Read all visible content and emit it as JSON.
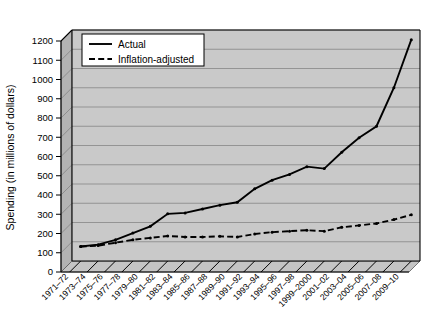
{
  "chart_data": {
    "type": "line",
    "title": "",
    "xlabel": "",
    "ylabel": "Spending (in millions of dollars)",
    "ylim": [
      0,
      1200
    ],
    "ytick_step": 100,
    "grid": true,
    "legend_position": "top-left",
    "categories": [
      "1971–72",
      "1973–74",
      "1975–76",
      "1977–78",
      "1979–80",
      "1981–82",
      "1983–84",
      "1985–86",
      "1987–88",
      "1989–90",
      "1991–92",
      "1993–94",
      "1995–96",
      "1997–98",
      "1999–2000",
      "2001–02",
      "2003–04",
      "2005–06",
      "2007–08",
      "2009–10"
    ],
    "yticks": [
      "0",
      "100",
      "200",
      "300",
      "400",
      "500",
      "600",
      "700",
      "800",
      "900",
      "1000",
      "1100",
      "1200"
    ],
    "series": [
      {
        "name": "Actual",
        "style": "solid",
        "color": "#000000",
        "values": [
          75,
          85,
          110,
          145,
          180,
          245,
          250,
          270,
          290,
          305,
          375,
          420,
          450,
          490,
          480,
          565,
          640,
          700,
          900,
          1150
        ]
      },
      {
        "name": "Inflation-adjusted",
        "style": "dashed",
        "color": "#000000",
        "values": [
          75,
          80,
          95,
          110,
          120,
          130,
          125,
          125,
          128,
          125,
          140,
          150,
          155,
          160,
          155,
          175,
          185,
          195,
          215,
          240
        ]
      }
    ]
  },
  "legend": {
    "entries": [
      {
        "label": "Actual",
        "style": "solid"
      },
      {
        "label": "Inflation-adjusted",
        "style": "dashed"
      }
    ]
  },
  "axis": {
    "y_title": "Spending (in millions of dollars)"
  }
}
